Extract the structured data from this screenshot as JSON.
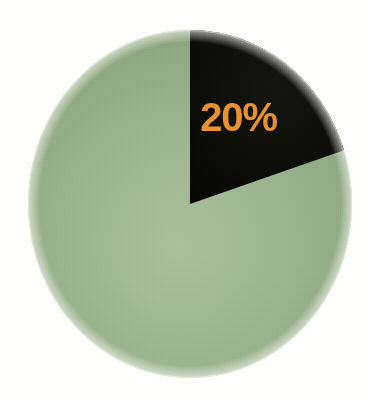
{
  "chart_data": {
    "type": "pie",
    "title": "",
    "subtitle": "",
    "xlabel": "",
    "ylabel": "",
    "legend": "none",
    "grid": false,
    "start_angle_deg": 0,
    "direction": "clockwise",
    "units": "percent",
    "categories": [
      "Highlighted share",
      "Remainder"
    ],
    "values": [
      20,
      80
    ],
    "labels": [
      "20%",
      ""
    ],
    "data_labels_shown": [
      "20%"
    ],
    "colors": [
      "#0a0a08",
      "#8ea983"
    ],
    "slices": [
      {
        "name": "Highlighted share",
        "value": 20,
        "label": "20%",
        "color": "#0a0a08",
        "label_color": "#e8922f",
        "start_angle_deg": 0,
        "end_angle_deg": 72,
        "label_shown": true
      },
      {
        "name": "Remainder",
        "value": 80,
        "label": "",
        "color": "#8ea983",
        "label_color": "",
        "start_angle_deg": 72,
        "end_angle_deg": 360,
        "label_shown": false
      }
    ],
    "annotations": []
  },
  "figure": {
    "background_color": "#fefefc",
    "width": 368,
    "height": 400,
    "center_x": 190,
    "center_y": 204,
    "radius_x": 162,
    "radius_y": 174
  },
  "palette": {
    "background": "#fefefc",
    "slice_dark": "#0a0a08",
    "slice_green": "#8ea983",
    "slice_green_light": "#a9c09c",
    "slice_green_dark": "#6f8663",
    "label_orange": "#e8922f"
  }
}
